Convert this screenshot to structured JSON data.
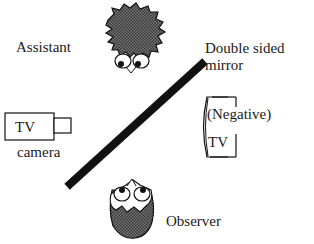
{
  "diagram": {
    "labels": {
      "assistant": "Assistant",
      "double_sided": "Double sided",
      "mirror": "mirror",
      "tv_camera_box": "TV",
      "camera": "camera",
      "negative": "(Negative)",
      "tv_monitor": "TV",
      "observer": "Observer"
    },
    "icons": {
      "assistant": "assistant-face-icon",
      "observer": "observer-face-icon",
      "camera": "tv-camera-icon",
      "monitor": "tv-monitor-icon",
      "mirror": "mirror-line"
    },
    "colors": {
      "ink": "#111111",
      "hatch": "#555555",
      "background": "#ffffff"
    }
  }
}
